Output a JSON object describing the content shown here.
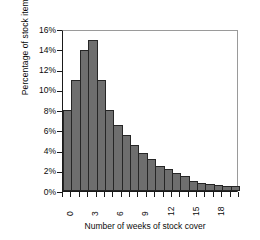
{
  "chart_data": {
    "type": "bar",
    "title": "",
    "subtitle": "",
    "xlabel": "Number of weeks of stock cover",
    "ylabel": "Percentage of stock items",
    "xlim": [
      0,
      21
    ],
    "ylim": [
      0,
      16
    ],
    "grid": false,
    "legend": null,
    "bar_color": "#6e6e6e",
    "bar_edge_color": "#262626",
    "axis_color": "#1a1a1a",
    "frame_color": "#9a9a9a",
    "background": "#ffffff",
    "x_tick_labels": [
      "0",
      "3",
      "6",
      "9",
      "12",
      "15",
      "18"
    ],
    "x_tick_values": [
      0,
      3,
      6,
      9,
      12,
      15,
      18
    ],
    "y_tick_labels": [
      "0%",
      "2%",
      "4%",
      "6%",
      "8%",
      "10%",
      "12%",
      "14%",
      "16%"
    ],
    "y_tick_values": [
      0,
      2,
      4,
      6,
      8,
      10,
      12,
      14,
      16
    ],
    "categories": [
      0,
      1,
      2,
      3,
      4,
      5,
      6,
      7,
      8,
      9,
      10,
      11,
      12,
      13,
      14,
      15,
      16,
      17,
      18,
      19,
      20
    ],
    "values": [
      8.0,
      11.0,
      13.9,
      14.9,
      11.0,
      8.0,
      6.5,
      5.5,
      4.5,
      3.8,
      3.2,
      2.5,
      2.2,
      1.8,
      1.5,
      1.0,
      0.8,
      0.7,
      0.6,
      0.5,
      0.5
    ],
    "units": "percent",
    "bar_count": 21
  }
}
